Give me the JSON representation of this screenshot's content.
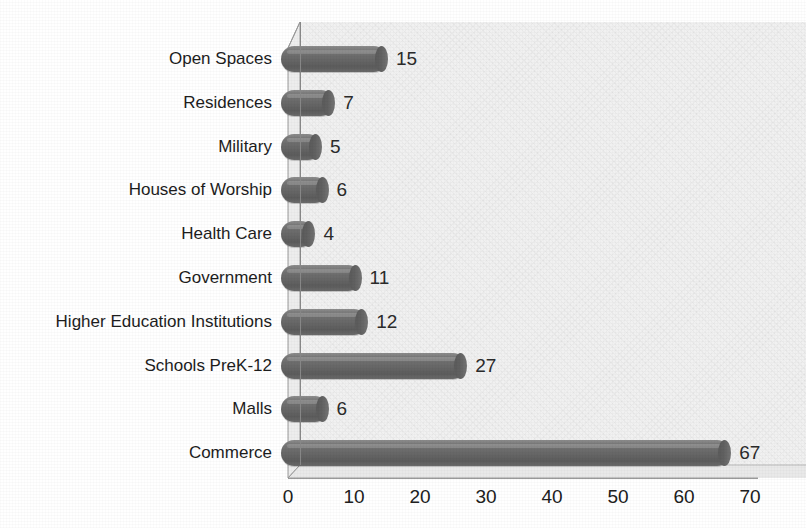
{
  "chart_data": {
    "type": "bar",
    "orientation": "horizontal",
    "style": "3d-cylinder",
    "title": "",
    "xlabel": "",
    "ylabel": "",
    "categories": [
      "Open Spaces",
      "Residences",
      "Military",
      "Houses of Worship",
      "Health Care",
      "Government",
      "Higher Education Institutions",
      "Schools PreK-12",
      "Malls",
      "Commerce"
    ],
    "values": [
      15,
      7,
      5,
      6,
      4,
      11,
      12,
      27,
      6,
      67
    ],
    "data_labels": [
      "15",
      "7",
      "5",
      "6",
      "4",
      "11",
      "12",
      "27",
      "6",
      "67"
    ],
    "xlim": [
      0,
      70
    ],
    "xticks": [
      0,
      10,
      20,
      30,
      40,
      50,
      60,
      70
    ],
    "xtick_labels": [
      "0",
      "10",
      "20",
      "30",
      "40",
      "50",
      "60",
      "70"
    ],
    "grid": false,
    "legend": null,
    "colors": {
      "bar": "#6b6b6b",
      "bar_highlight": "#8d8d8d",
      "bar_shadow": "#5a5a5a",
      "wall": "#f1f1f1",
      "floor": "#e3e3e3",
      "side_panel": "#ededed",
      "axis_line": "#8a8a8a",
      "text": "#1d1d1d",
      "background": "#ffffff"
    }
  }
}
